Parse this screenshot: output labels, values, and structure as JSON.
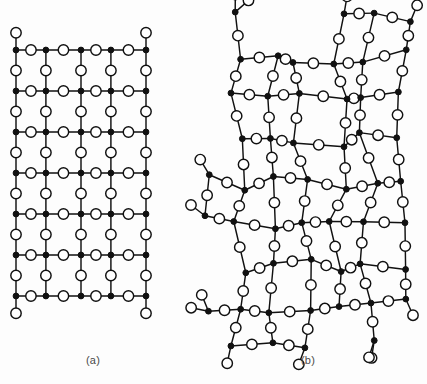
{
  "figure": {
    "width": 427,
    "height": 384,
    "background_color": "#fdfdfd"
  },
  "legend": {
    "oxygen_symbol": "open-circle",
    "oxygen_label": "oxygen atom",
    "oxygen_color": "#ffffff",
    "silicon_symbol": "filled-circle",
    "silicon_label": "silicon atom",
    "silicon_color": "#111111",
    "bond_color": "#111111"
  },
  "style": {
    "oxygen_radius": 5.2,
    "silicon_radius": 2.9,
    "bond_width": 1.45
  },
  "panels": [
    {
      "id": "a",
      "caption": "(a)",
      "structure": "crystalline",
      "description": "ordered periodic hexagonal rings",
      "origin_x": 16,
      "origin_y": 50,
      "cell_width": 65,
      "cell_height": 41,
      "columns": 2,
      "rows": 6,
      "ring_size": 6
    },
    {
      "id": "b",
      "caption": "(b)",
      "structure": "amorphous",
      "description": "random network with irregular rings",
      "origin_x": 206,
      "origin_y": 14,
      "cell_width": 66,
      "cell_height": 42,
      "columns": 3,
      "rows": 8,
      "ring_size_range": [
        5,
        7
      ],
      "disorder_amplitude": 9.5,
      "random_seed": 20173
    }
  ],
  "chart_data": {
    "type": "diagram",
    "node_types": [
      {
        "name": "oxygen",
        "marker": "open circle",
        "coordination": 2
      },
      {
        "name": "silicon",
        "marker": "filled circle",
        "coordination": 3
      }
    ],
    "panels": [
      {
        "label": "(a)",
        "name": "crystalline silica",
        "lattice": "periodic hexagonal",
        "rings": 12,
        "ring_size": 6,
        "long_range_order": true
      },
      {
        "label": "(b)",
        "name": "amorphous silica (glass)",
        "lattice": "continuous random network",
        "rings": 17,
        "ring_size_range": [
          5,
          7
        ],
        "long_range_order": false
      }
    ]
  }
}
